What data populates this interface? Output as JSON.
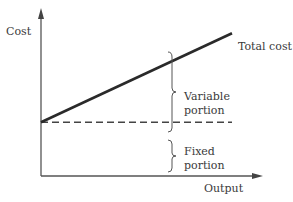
{
  "chart_data": {
    "type": "line",
    "title": "",
    "xlabel": "Output",
    "ylabel": "Cost",
    "grid": false,
    "series": [
      {
        "name": "Total cost",
        "style": "solid",
        "x": [
          0,
          1
        ],
        "y": [
          0.32,
          0.85
        ]
      },
      {
        "name": "Fixed cost",
        "style": "dashed",
        "x": [
          0,
          1
        ],
        "y": [
          0.32,
          0.32
        ]
      }
    ],
    "annotations": [
      {
        "text_lines": [
          "Variable",
          "portion"
        ],
        "bracket": "between fixed line and total cost line"
      },
      {
        "text_lines": [
          "Fixed",
          "portion"
        ],
        "bracket": "between output axis and fixed line"
      }
    ],
    "line_label": "Total cost",
    "colors": {
      "line": "#2a2a2a",
      "axis": "#555555",
      "text": "#3a3a3a"
    }
  }
}
